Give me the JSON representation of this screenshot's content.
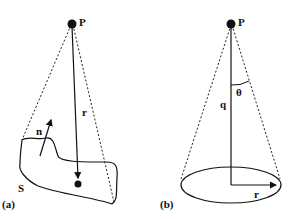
{
  "panel_a": {
    "caption": "(a)",
    "point_label": "P",
    "vector_label": "r",
    "normal_label": "n",
    "surface_label": "S"
  },
  "panel_b": {
    "caption": "(b)",
    "point_label": "P",
    "axis_label": "q",
    "angle_label": "θ",
    "radius_label": "r"
  }
}
